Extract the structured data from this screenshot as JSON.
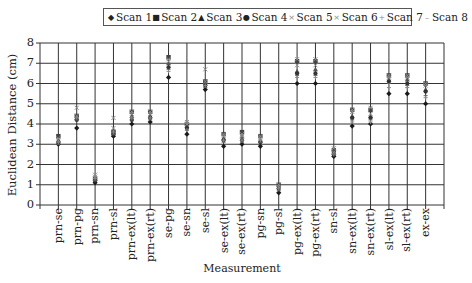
{
  "chart_data": {
    "type": "scatter",
    "title": "",
    "xlabel": "Measurement",
    "ylabel": "Euclidean Distance (cm)",
    "ylim": [
      0,
      8
    ],
    "yticks": [
      "0",
      "1",
      "2",
      "3",
      "4",
      "5",
      "6",
      "7",
      "8"
    ],
    "grid": true,
    "legend_position": "top",
    "categories": [
      "prn-se",
      "prn-pg",
      "prn-sn",
      "prn-sl",
      "prn-ex(lt)",
      "prn-ex(rt)",
      "se-pg",
      "se-sn",
      "se-sl",
      "se-ex(lt)",
      "se-ex(rt)",
      "pg-sn",
      "pg-sl",
      "pg-ex(lt)",
      "pg-ex(rt)",
      "sn-sl",
      "sn-ex(lt)",
      "sn-ex(rt)",
      "sl-ex(lt)",
      "sl-ex(rt)",
      "ex-ex"
    ],
    "series": [
      {
        "name": "Scan 1",
        "marker": "diamond",
        "values": [
          3.0,
          3.8,
          1.1,
          3.4,
          4.0,
          4.1,
          6.3,
          3.5,
          5.7,
          2.9,
          3.0,
          2.9,
          0.6,
          6.0,
          6.0,
          2.4,
          3.9,
          4.0,
          5.5,
          5.5,
          5.0
        ]
      },
      {
        "name": "Scan 2",
        "marker": "square",
        "values": [
          3.4,
          4.4,
          1.3,
          3.6,
          4.6,
          4.6,
          7.3,
          4.0,
          6.1,
          3.5,
          3.6,
          3.4,
          1.0,
          7.1,
          7.1,
          2.7,
          4.7,
          4.7,
          6.4,
          6.4,
          6.0
        ]
      },
      {
        "name": "Scan 3",
        "marker": "triangle",
        "values": [
          3.2,
          4.3,
          1.3,
          3.7,
          4.4,
          4.4,
          7.0,
          3.9,
          6.0,
          3.3,
          3.4,
          3.2,
          0.9,
          6.6,
          6.7,
          2.6,
          4.4,
          4.4,
          6.2,
          6.2,
          5.7
        ]
      },
      {
        "name": "Scan 4",
        "marker": "circle",
        "values": [
          3.1,
          4.2,
          1.2,
          3.5,
          4.2,
          4.3,
          6.8,
          3.8,
          5.9,
          3.2,
          3.2,
          3.1,
          0.8,
          6.5,
          6.5,
          2.5,
          4.3,
          4.3,
          6.1,
          6.0,
          5.6
        ]
      },
      {
        "name": "Scan 5",
        "marker": "x",
        "values": [
          3.2,
          4.4,
          1.4,
          3.8,
          4.5,
          4.5,
          7.1,
          4.0,
          6.1,
          3.4,
          3.4,
          3.3,
          0.9,
          6.9,
          6.9,
          2.6,
          4.6,
          4.5,
          6.3,
          6.3,
          5.9
        ]
      },
      {
        "name": "Scan 6",
        "marker": "x",
        "values": [
          3.3,
          4.8,
          1.5,
          4.3,
          4.6,
          4.6,
          7.2,
          4.1,
          6.7,
          3.5,
          3.5,
          3.4,
          1.0,
          7.2,
          7.2,
          2.8,
          4.7,
          4.8,
          6.4,
          6.4,
          6.0
        ]
      },
      {
        "name": "Scan 7",
        "marker": "plus",
        "values": [
          3.1,
          4.3,
          1.3,
          3.6,
          4.3,
          4.3,
          6.6,
          3.7,
          5.9,
          3.2,
          3.2,
          3.2,
          0.8,
          6.3,
          6.3,
          2.5,
          4.1,
          4.1,
          5.8,
          5.8,
          5.3
        ]
      },
      {
        "name": "Scan 8",
        "marker": "dash",
        "values": [
          3.0,
          4.2,
          1.2,
          3.5,
          4.2,
          4.2,
          6.7,
          3.7,
          5.8,
          3.1,
          3.1,
          3.1,
          0.7,
          6.4,
          6.4,
          2.5,
          4.2,
          4.2,
          6.0,
          5.9,
          5.4
        ]
      }
    ]
  },
  "legend": {
    "items": [
      {
        "label": "Scan 1",
        "glyph": "◆"
      },
      {
        "label": "Scan 2",
        "glyph": "■"
      },
      {
        "label": "Scan 3",
        "glyph": "▲"
      },
      {
        "label": "Scan 4",
        "glyph": "●"
      },
      {
        "label": "Scan 5",
        "glyph": "×"
      },
      {
        "label": "Scan 6",
        "glyph": "×"
      },
      {
        "label": "Scan 7",
        "glyph": "+"
      },
      {
        "label": "Scan 8",
        "glyph": "–"
      }
    ]
  },
  "axes": {
    "xlabel": "Measurement",
    "ylabel": "Euclidean Distance (cm)"
  },
  "colors": {
    "marker": "#1a1a1a",
    "marker_light": "#8a8a8a",
    "grid": "#333333"
  }
}
